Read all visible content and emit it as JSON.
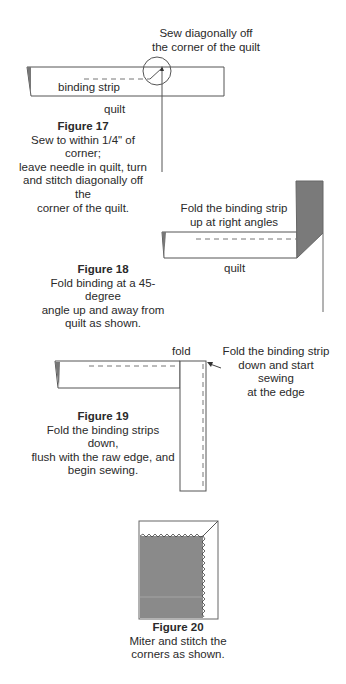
{
  "figure17": {
    "callout_lines": [
      "Sew diagonally off",
      "the corner of the quilt"
    ],
    "strip_label": "binding strip",
    "quilt_label": "quilt",
    "title": "Figure 17",
    "caption_lines": [
      "Sew to within 1/4\" of corner;",
      "leave needle in quilt, turn",
      "and stitch diagonally off the",
      "corner of the quilt."
    ]
  },
  "figure18": {
    "callout_lines": [
      "Fold the binding strip",
      "up at right angles"
    ],
    "quilt_label": "quilt",
    "title": "Figure 18",
    "caption_lines": [
      "Fold binding at a 45-degree",
      "angle up and away from",
      "quilt as shown."
    ],
    "strip_color": "#7a7a7a"
  },
  "figure19": {
    "fold_label": "fold",
    "callout_lines": [
      "Fold the binding strip",
      "down and start",
      "sewing",
      "at the edge"
    ],
    "title": "Figure 19",
    "caption_lines": [
      "Fold the binding strips down,",
      "flush with the raw edge, and",
      "begin sewing."
    ]
  },
  "figure20": {
    "title": "Figure 20",
    "caption_lines": [
      "Miter and stitch the",
      "corners as shown."
    ],
    "quilt_color": "#8a8a8a"
  }
}
